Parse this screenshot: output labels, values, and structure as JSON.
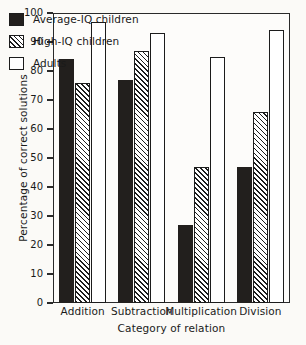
{
  "chart_data": {
    "type": "bar",
    "title": "",
    "xlabel": "Category of relation",
    "ylabel": "Percentage of correct solutions",
    "categories": [
      "Addition",
      "Subtraction",
      "Multiplication",
      "Division"
    ],
    "series": [
      {
        "name": "Average-IQ children",
        "style": "solid-black",
        "color": "#221f1d",
        "values": [
          84,
          77,
          27,
          47
        ]
      },
      {
        "name": "High-IQ children",
        "style": "diagonal-hatch",
        "color": "#1c1c1c",
        "values": [
          76,
          87,
          47,
          66
        ]
      },
      {
        "name": "Adults",
        "style": "white-outline",
        "color": "#ffffff",
        "values": [
          97,
          93,
          85,
          94
        ]
      }
    ],
    "ylim": [
      0,
      100
    ],
    "ytick_labels": [
      "0",
      "10",
      "20",
      "30",
      "40",
      "50",
      "60",
      "70",
      "80",
      "90",
      "100"
    ],
    "ytick_values": [
      0,
      10,
      20,
      30,
      40,
      50,
      60,
      70,
      80,
      90,
      100
    ],
    "grid": false,
    "legend_position": "top-left-inside",
    "axis_color": "#2a2a2a",
    "background_color": "#fbfaf7"
  },
  "legend": {
    "items": [
      {
        "label": "Average-IQ children",
        "swatch": "solid-black-swatch"
      },
      {
        "label": "High-IQ children",
        "swatch": "hatched-swatch"
      },
      {
        "label": "Adults",
        "swatch": "white-swatch"
      }
    ]
  }
}
